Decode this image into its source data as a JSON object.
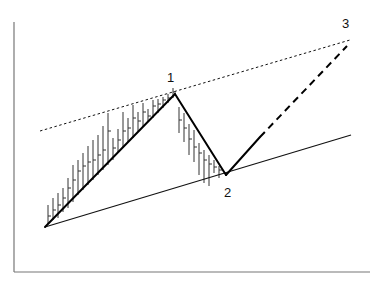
{
  "chart_data": {
    "type": "line",
    "title": "",
    "xlabel": "",
    "ylabel": "",
    "grid": false,
    "axes": {
      "left": [
        14,
        22,
        14,
        272
      ],
      "bottom": [
        14,
        272,
        370,
        272
      ]
    },
    "points": [
      {
        "label": "",
        "x": 45,
        "y": 227
      },
      {
        "label": "1",
        "x": 175,
        "y": 94
      },
      {
        "label": "2",
        "x": 226,
        "y": 175
      },
      {
        "label": "3",
        "x": 347,
        "y": 46
      }
    ],
    "labels": [
      {
        "text": "1",
        "x": 167,
        "y": 82
      },
      {
        "text": "2",
        "x": 224,
        "y": 197
      },
      {
        "text": "3",
        "x": 342,
        "y": 28
      }
    ],
    "upper_trendline": {
      "style": "dotted",
      "from": [
        40,
        131
      ],
      "to": [
        350,
        40
      ]
    },
    "lower_trendline": {
      "style": "solid",
      "from": [
        45,
        227
      ],
      "to": [
        351,
        135
      ]
    },
    "projection_solid": {
      "from": [
        226,
        175
      ],
      "to": [
        260,
        137
      ]
    },
    "projection_dashed": {
      "from": [
        260,
        137
      ],
      "to": [
        347,
        46
      ]
    },
    "bars": [
      [
        48,
        205,
        224,
        216
      ],
      [
        53,
        198,
        220,
        210
      ],
      [
        58,
        193,
        218,
        205
      ],
      [
        63,
        188,
        212,
        198
      ],
      [
        68,
        178,
        208,
        188
      ],
      [
        73,
        165,
        202,
        180
      ],
      [
        78,
        160,
        195,
        171
      ],
      [
        83,
        153,
        190,
        166
      ],
      [
        88,
        146,
        185,
        162
      ],
      [
        93,
        140,
        180,
        160
      ],
      [
        98,
        135,
        175,
        155
      ],
      [
        103,
        126,
        170,
        150
      ],
      [
        108,
        113,
        165,
        131
      ],
      [
        113,
        138,
        160,
        148
      ],
      [
        118,
        129,
        152,
        140
      ],
      [
        123,
        112,
        148,
        131
      ],
      [
        128,
        118,
        142,
        128
      ],
      [
        133,
        105,
        138,
        118
      ],
      [
        138,
        112,
        131,
        121
      ],
      [
        143,
        103,
        127,
        112
      ],
      [
        148,
        109,
        122,
        116
      ],
      [
        153,
        100,
        118,
        106
      ],
      [
        158,
        99,
        113,
        104
      ],
      [
        163,
        97,
        108,
        100
      ],
      [
        168,
        94,
        103,
        98
      ],
      [
        173,
        88,
        98,
        92
      ],
      [
        179,
        107,
        133,
        120
      ],
      [
        184,
        113,
        142,
        128
      ],
      [
        189,
        124,
        155,
        139
      ],
      [
        194,
        130,
        162,
        147
      ],
      [
        199,
        143,
        175,
        153
      ],
      [
        204,
        150,
        183,
        160
      ],
      [
        209,
        155,
        186,
        164
      ],
      [
        214,
        160,
        173,
        167
      ],
      [
        219,
        166,
        178,
        170
      ]
    ]
  }
}
